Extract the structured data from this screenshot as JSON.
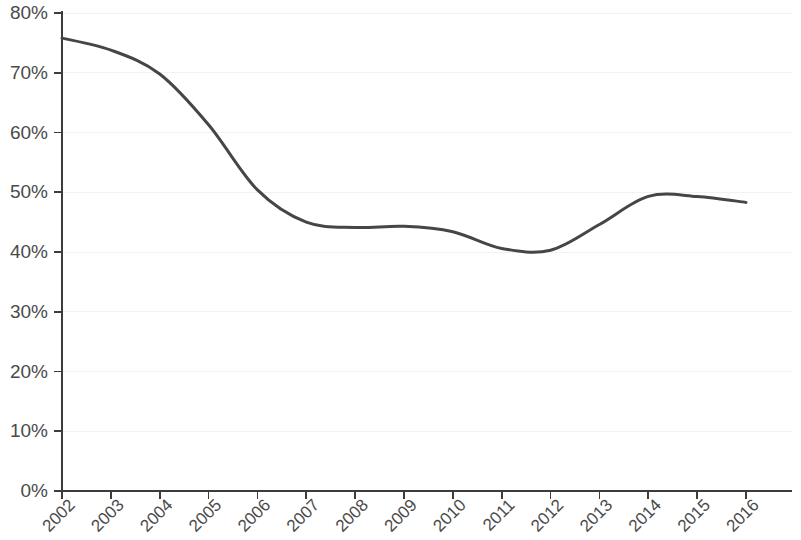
{
  "chart_data": {
    "type": "line",
    "title": "",
    "subtitle": "",
    "xlabel": "",
    "ylabel": "",
    "grid": true,
    "legend": "none",
    "xlim": [
      2002,
      2016
    ],
    "ylim": [
      0,
      80
    ],
    "ytick_labels": [
      "0%",
      "10%",
      "20%",
      "30%",
      "40%",
      "50%",
      "60%",
      "70%",
      "80%"
    ],
    "ytick_values": [
      0,
      10,
      20,
      30,
      40,
      50,
      60,
      70,
      80
    ],
    "categories": [
      "2002",
      "2003",
      "2004",
      "2005",
      "2006",
      "2007",
      "2008",
      "2009",
      "2010",
      "2011",
      "2012",
      "2013",
      "2014",
      "2015",
      "2016"
    ],
    "x": [
      2002,
      2003,
      2004,
      2005,
      2006,
      2007,
      2008,
      2009,
      2010,
      2011,
      2012,
      2013,
      2014,
      2015,
      2016
    ],
    "series": [
      {
        "name": "",
        "color": "#464646",
        "values": [
          75.8,
          73.8,
          69.8,
          61.3,
          50.4,
          45.0,
          44.1,
          44.3,
          43.4,
          40.6,
          40.3,
          44.6,
          49.3,
          49.3,
          48.3
        ]
      }
    ],
    "line_color": "#464646",
    "grid_color": "#f2f2f4",
    "axis_color": "#3c3c3c",
    "label_color": "#4a4a4a"
  }
}
